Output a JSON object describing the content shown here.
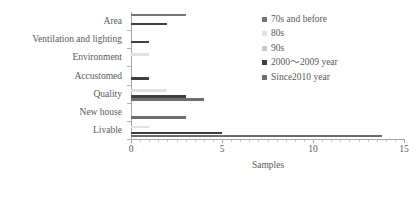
{
  "chart_data": {
    "type": "bar",
    "orientation": "horizontal",
    "title": "",
    "xlabel": "Samples",
    "ylabel": "",
    "xlim": [
      0,
      15
    ],
    "xticks": [
      0,
      5,
      10,
      15
    ],
    "xtick_labels": [
      "0",
      "5",
      "10",
      "15"
    ],
    "grid": false,
    "legend_position": "right",
    "categories": [
      "Area",
      "Ventilation and lighting",
      "Environment",
      "Accustomed",
      "Quality",
      "New house",
      "Livable"
    ],
    "series": [
      {
        "name": "70s and before",
        "color": "#767676",
        "values": [
          3,
          0,
          0,
          0,
          0,
          0,
          0
        ]
      },
      {
        "name": "80s",
        "color": "#e2e2e2",
        "values": [
          0,
          0,
          1,
          0,
          2,
          0,
          1
        ]
      },
      {
        "name": "90s",
        "color": "#c9c9c9",
        "values": [
          0,
          0,
          0,
          0,
          0,
          0,
          0
        ]
      },
      {
        "name": "2000～2009 year",
        "color": "#3f3f3f",
        "values": [
          2,
          1,
          0,
          1,
          3,
          0,
          5
        ]
      },
      {
        "name": "Since2010 year",
        "color": "#6e6e6e",
        "values": [
          0,
          0,
          0,
          0,
          4,
          3,
          13.8
        ]
      }
    ]
  },
  "legend": {
    "items": [
      {
        "label": "70s and before",
        "color": "#767676"
      },
      {
        "label": "80s",
        "color": "#e2e2e2"
      },
      {
        "label": "90s",
        "color": "#c9c9c9"
      },
      {
        "label": "2000～2009 year",
        "color": "#3f3f3f"
      },
      {
        "label": "Since2010 year",
        "color": "#6e6e6e"
      }
    ]
  },
  "axis": {
    "x_title": "Samples",
    "x_tick_labels": [
      "0",
      "5",
      "10",
      "15"
    ],
    "y_tick_labels": [
      "Area",
      "Ventilation and lighting",
      "Environment",
      "Accustomed",
      "Quality",
      "New house",
      "Livable"
    ]
  }
}
